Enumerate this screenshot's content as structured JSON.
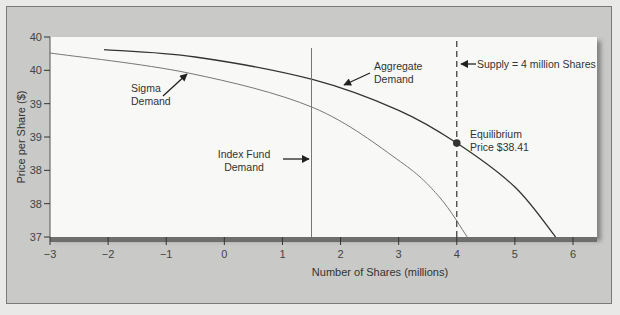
{
  "chart_data": {
    "type": "line",
    "title": "",
    "xlabel": "Number of Shares (millions)",
    "ylabel": "Price per Share ($)",
    "xlim": [
      -3,
      6
    ],
    "ylim": [
      37,
      40
    ],
    "x_ticks": [
      -3,
      -2,
      -1,
      0,
      1,
      2,
      3,
      4,
      5,
      6
    ],
    "x_tick_labels": [
      "−3",
      "−2",
      "−1",
      "0",
      "1",
      "2",
      "3",
      "4",
      "5",
      "6"
    ],
    "y_ticks": [
      37.0,
      37.5,
      38.0,
      38.5,
      39.0,
      39.5,
      40.0
    ],
    "y_tick_labels": [
      "37",
      "38",
      "38",
      "39",
      "39",
      "40",
      "40"
    ],
    "grid": false,
    "series": [
      {
        "name": "Aggregate Demand",
        "color": "#333333",
        "points": [
          [
            -2.07,
            39.81
          ],
          [
            -0.5,
            39.7
          ],
          [
            1.53,
            39.36
          ],
          [
            3.0,
            38.9
          ],
          [
            4.0,
            38.41
          ],
          [
            5.0,
            37.75
          ],
          [
            5.7,
            37.0
          ]
        ]
      },
      {
        "name": "Sigma Demand",
        "color": "#777777",
        "points": [
          [
            -3.0,
            39.76
          ],
          [
            -0.62,
            39.46
          ],
          [
            1.53,
            38.94
          ],
          [
            3.03,
            38.13
          ],
          [
            3.7,
            37.6
          ],
          [
            4.18,
            37.0
          ]
        ]
      },
      {
        "name": "Index Fund Demand",
        "color": "#777777",
        "vertical_line_x": 1.5
      },
      {
        "name": "Supply = 4 million Shares",
        "color": "#333333",
        "style": "dashed",
        "vertical_line_x": 4
      }
    ],
    "annotations": [
      {
        "text": [
          "Sigma",
          "Demand"
        ],
        "x": -1.5,
        "y": 39.3
      },
      {
        "text": [
          "Aggregate",
          "Demand"
        ],
        "x": 2.6,
        "y": 39.6
      },
      {
        "text": [
          "Index Fund",
          "Demand"
        ],
        "x": 0.3,
        "y": 38.6
      },
      {
        "text": [
          "Supply = 4 million Shares"
        ],
        "x": 4.1,
        "y": 39.75
      },
      {
        "text": [
          "Equilibrium",
          "Price $38.41"
        ],
        "x": 4.15,
        "y": 38.5
      }
    ],
    "equilibrium": {
      "x": 4,
      "y": 38.41,
      "label": "Equilibrium Price $38.41"
    },
    "legend": "none (inline annotations)"
  },
  "labels": {
    "sigma": [
      "Sigma",
      "Demand"
    ],
    "aggregate": [
      "Aggregate",
      "Demand"
    ],
    "index_fund": [
      "Index Fund",
      "Demand"
    ],
    "supply": "Supply = 4 million Shares",
    "equilibrium": [
      "Equilibrium",
      "Price $38.41"
    ]
  }
}
